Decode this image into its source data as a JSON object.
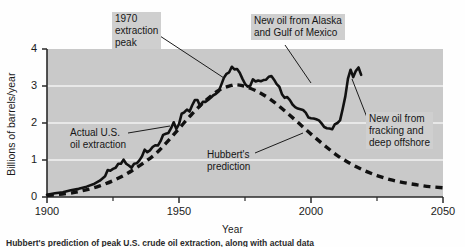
{
  "figure": {
    "caption": "Hubbert's prediction of peak U.S. crude oil extraction, along with actual data",
    "background_color": "#ffffff",
    "plot_background_color": "#c9c9c9",
    "gridline_color": "#f2f2f2",
    "curve_color": "#111111"
  },
  "chart_data": {
    "type": "line",
    "title": "",
    "xlabel": "Year",
    "ylabel": "Billions of barrels/year",
    "xlim": [
      1900,
      2050
    ],
    "ylim": [
      0,
      4
    ],
    "xticks": [
      1900,
      1950,
      2000,
      2050
    ],
    "xtick_labels": [
      "1900",
      "1950",
      "2000",
      "2050"
    ],
    "xminor_ticks": [
      1925,
      1975,
      2025
    ],
    "yticks": [
      0,
      1,
      2,
      3,
      4
    ],
    "ytick_labels": [
      "0",
      "1",
      "2",
      "3",
      "4"
    ],
    "grid": "horizontal-white-at-1-2-3",
    "legend": "none (in-plot annotations)",
    "series": [
      {
        "name": "Actual U.S. oil extraction",
        "style": "solid",
        "color": "#111111",
        "points": [
          [
            1900,
            0.06
          ],
          [
            1903,
            0.1
          ],
          [
            1906,
            0.13
          ],
          [
            1909,
            0.18
          ],
          [
            1912,
            0.22
          ],
          [
            1915,
            0.28
          ],
          [
            1918,
            0.36
          ],
          [
            1920,
            0.44
          ],
          [
            1922,
            0.56
          ],
          [
            1923,
            0.73
          ],
          [
            1924,
            0.71
          ],
          [
            1925,
            0.76
          ],
          [
            1926,
            0.79
          ],
          [
            1927,
            0.9
          ],
          [
            1928,
            0.9
          ],
          [
            1929,
            1.01
          ],
          [
            1930,
            0.9
          ],
          [
            1931,
            0.85
          ],
          [
            1932,
            0.79
          ],
          [
            1933,
            0.9
          ],
          [
            1934,
            0.91
          ],
          [
            1935,
            0.99
          ],
          [
            1936,
            1.1
          ],
          [
            1937,
            1.28
          ],
          [
            1938,
            1.21
          ],
          [
            1939,
            1.26
          ],
          [
            1940,
            1.35
          ],
          [
            1941,
            1.4
          ],
          [
            1942,
            1.39
          ],
          [
            1943,
            1.51
          ],
          [
            1944,
            1.68
          ],
          [
            1945,
            1.71
          ],
          [
            1946,
            1.73
          ],
          [
            1947,
            1.86
          ],
          [
            1948,
            2.02
          ],
          [
            1949,
            1.84
          ],
          [
            1950,
            1.97
          ],
          [
            1951,
            2.25
          ],
          [
            1952,
            2.29
          ],
          [
            1953,
            2.36
          ],
          [
            1954,
            2.31
          ],
          [
            1955,
            2.48
          ],
          [
            1956,
            2.62
          ],
          [
            1957,
            2.62
          ],
          [
            1958,
            2.45
          ],
          [
            1959,
            2.57
          ],
          [
            1960,
            2.57
          ],
          [
            1961,
            2.62
          ],
          [
            1962,
            2.68
          ],
          [
            1963,
            2.75
          ],
          [
            1964,
            2.79
          ],
          [
            1965,
            2.85
          ],
          [
            1966,
            3.03
          ],
          [
            1967,
            3.22
          ],
          [
            1968,
            3.33
          ],
          [
            1969,
            3.37
          ],
          [
            1970,
            3.52
          ],
          [
            1971,
            3.45
          ],
          [
            1972,
            3.46
          ],
          [
            1973,
            3.36
          ],
          [
            1974,
            3.2
          ],
          [
            1975,
            3.06
          ],
          [
            1976,
            2.98
          ],
          [
            1977,
            3.01
          ],
          [
            1978,
            3.18
          ],
          [
            1979,
            3.12
          ],
          [
            1980,
            3.15
          ],
          [
            1981,
            3.13
          ],
          [
            1982,
            3.16
          ],
          [
            1983,
            3.17
          ],
          [
            1984,
            3.25
          ],
          [
            1985,
            3.27
          ],
          [
            1986,
            3.17
          ],
          [
            1987,
            3.05
          ],
          [
            1988,
            2.98
          ],
          [
            1989,
            2.78
          ],
          [
            1990,
            2.68
          ],
          [
            1991,
            2.7
          ],
          [
            1992,
            2.62
          ],
          [
            1993,
            2.5
          ],
          [
            1994,
            2.43
          ],
          [
            1995,
            2.39
          ],
          [
            1996,
            2.37
          ],
          [
            1997,
            2.35
          ],
          [
            1998,
            2.28
          ],
          [
            1999,
            2.15
          ],
          [
            2000,
            2.13
          ],
          [
            2001,
            2.12
          ],
          [
            2002,
            2.1
          ],
          [
            2003,
            2.07
          ],
          [
            2004,
            1.99
          ],
          [
            2005,
            1.89
          ],
          [
            2006,
            1.86
          ],
          [
            2007,
            1.85
          ],
          [
            2008,
            1.83
          ],
          [
            2009,
            1.96
          ],
          [
            2010,
            2.0
          ],
          [
            2011,
            2.07
          ],
          [
            2012,
            2.38
          ],
          [
            2013,
            2.72
          ],
          [
            2014,
            3.2
          ],
          [
            2015,
            3.44
          ],
          [
            2016,
            3.24
          ],
          [
            2017,
            3.41
          ],
          [
            2018,
            3.5
          ],
          [
            2019,
            3.3
          ]
        ]
      },
      {
        "name": "Hubbert's prediction",
        "style": "dashed",
        "color": "#111111",
        "points": [
          [
            1900,
            0.04
          ],
          [
            1910,
            0.12
          ],
          [
            1920,
            0.3
          ],
          [
            1930,
            0.62
          ],
          [
            1940,
            1.1
          ],
          [
            1945,
            1.45
          ],
          [
            1950,
            1.85
          ],
          [
            1955,
            2.25
          ],
          [
            1960,
            2.6
          ],
          [
            1965,
            2.88
          ],
          [
            1970,
            3.02
          ],
          [
            1972,
            3.03
          ],
          [
            1975,
            2.99
          ],
          [
            1980,
            2.84
          ],
          [
            1985,
            2.62
          ],
          [
            1990,
            2.33
          ],
          [
            1995,
            2.02
          ],
          [
            2000,
            1.7
          ],
          [
            2005,
            1.4
          ],
          [
            2010,
            1.12
          ],
          [
            2015,
            0.9
          ],
          [
            2020,
            0.72
          ],
          [
            2025,
            0.58
          ],
          [
            2030,
            0.47
          ],
          [
            2035,
            0.39
          ],
          [
            2040,
            0.33
          ],
          [
            2045,
            0.28
          ],
          [
            2050,
            0.25
          ]
        ]
      }
    ],
    "annotations": [
      {
        "id": "peak-1970",
        "text": "1970\nextraction\npeak",
        "boxed": true,
        "box_left": 112,
        "box_top": 12,
        "leader_from": [
          160,
          36
        ],
        "leader_to": [
          224,
          78
        ]
      },
      {
        "id": "alaska-gulf",
        "text": "New oil from Alaska\nand Gulf of Mexico",
        "boxed": true,
        "box_left": 251,
        "box_top": 14,
        "leader_from": [
          285,
          45
        ],
        "leader_to": [
          311,
          83
        ]
      },
      {
        "id": "actual-us-oil",
        "text": "Actual U.S.\noil extraction",
        "boxed": false,
        "box_left": 67,
        "box_top": 126,
        "leader_from": [
          128,
          133
        ],
        "leader_to": [
          170,
          126
        ]
      },
      {
        "id": "hubbert-prediction",
        "text": "Hubbert's\nprediction",
        "boxed": false,
        "box_left": 204,
        "box_top": 148,
        "leader_from": [
          255,
          153
        ],
        "leader_to": [
          303,
          133
        ]
      },
      {
        "id": "fracking-offshore",
        "text": "New oil from\nfracking and\ndeep offshore",
        "boxed": true,
        "box_left": 366,
        "box_top": 112,
        "leader_from": [
          368,
          120
        ],
        "leader_to": [
          352,
          79
        ]
      }
    ]
  }
}
